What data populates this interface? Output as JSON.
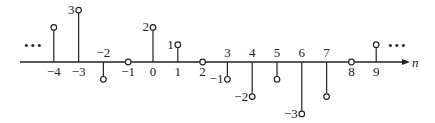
{
  "chart_data": {
    "type": "stem",
    "title": "",
    "xlabel": "n",
    "ylabel": "",
    "x": [
      -4,
      -3,
      -2,
      -1,
      0,
      1,
      2,
      3,
      4,
      5,
      6,
      7,
      8,
      9
    ],
    "values": [
      2,
      3,
      -1,
      0,
      2,
      1,
      0,
      -1,
      -2,
      -1,
      -3,
      -2,
      0,
      1
    ],
    "value_labels": [
      {
        "n": -3,
        "text": "3"
      },
      {
        "n": 0,
        "text": "2"
      },
      {
        "n": 1,
        "text": "1"
      },
      {
        "n": 3,
        "text": "−1"
      },
      {
        "n": 4,
        "text": "−2"
      },
      {
        "n": 6,
        "text": "−3"
      }
    ],
    "tick_labels": [
      "−4",
      "−3",
      "−2",
      "−1",
      "0",
      "1",
      "2",
      "3",
      "4",
      "5",
      "6",
      "7",
      "8",
      "9"
    ],
    "continuation_left": "•••",
    "continuation_right": "•••",
    "colors": {
      "line": "#222222",
      "background": "#ffffff"
    }
  }
}
